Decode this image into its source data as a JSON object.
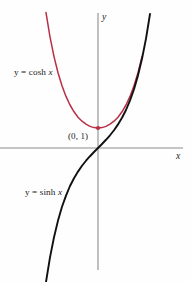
{
  "figure": {
    "background_color": "#fefefe",
    "width": 191,
    "height": 282
  },
  "axes": {
    "x_axis_label": "x",
    "y_axis_label": "y",
    "origin_px": [
      98,
      148
    ],
    "pixels_per_unit": 20,
    "axis_color": "#8b8b8b"
  },
  "labels": {
    "cosh_prefix": "y = ",
    "cosh_name": "cosh",
    "cosh_var": "x",
    "sinh_prefix": "y = ",
    "sinh_name": "sinh",
    "sinh_var": "x",
    "point_label": "(0, 1)"
  },
  "chart_data": {
    "type": "line",
    "title": "",
    "xlabel": "x",
    "ylabel": "y",
    "xlim": [
      -4.9,
      4.25
    ],
    "ylim": [
      -6.75,
      6.75
    ],
    "grid": false,
    "legend": "inline-annotations",
    "annotations": [
      {
        "text": "y = cosh x",
        "x": -4.2,
        "y": 3.75,
        "color": "#1a1a1a"
      },
      {
        "text": "y = sinh x",
        "x": -3.65,
        "y": -2.25,
        "color": "#1a1a1a"
      },
      {
        "text": "(0, 1)",
        "x": -1.5,
        "y": 0.55,
        "color": "#1a1a1a"
      }
    ],
    "markers": [
      {
        "label": "(0, 1)",
        "x": 0,
        "y": 1,
        "color": "#b92f46",
        "shape": "dot"
      }
    ],
    "series": [
      {
        "name": "y = cosh x",
        "color": "#b92f46",
        "x": [
          -2.6,
          -2.4,
          -2.2,
          -2.0,
          -1.8,
          -1.6,
          -1.4,
          -1.2,
          -1.0,
          -0.8,
          -0.6,
          -0.4,
          -0.2,
          0.0,
          0.2,
          0.4,
          0.6,
          0.8,
          1.0,
          1.2,
          1.4,
          1.6,
          1.8,
          2.0,
          2.2
        ],
        "values": [
          6.77,
          5.56,
          4.57,
          3.76,
          3.11,
          2.58,
          2.15,
          1.81,
          1.54,
          1.34,
          1.19,
          1.08,
          1.02,
          1.0,
          1.02,
          1.08,
          1.19,
          1.34,
          1.54,
          1.81,
          2.15,
          2.58,
          3.11,
          3.76,
          4.57
        ]
      },
      {
        "name": "y = sinh x",
        "color": "#111111",
        "x": [
          -2.6,
          -2.4,
          -2.2,
          -2.0,
          -1.8,
          -1.6,
          -1.4,
          -1.2,
          -1.0,
          -0.8,
          -0.6,
          -0.4,
          -0.2,
          0.0,
          0.2,
          0.4,
          0.6,
          0.8,
          1.0,
          1.2,
          1.4,
          1.6,
          1.8,
          2.0,
          2.2,
          2.4,
          2.6
        ],
        "values": [
          -6.7,
          -5.47,
          -4.46,
          -3.63,
          -2.94,
          -2.38,
          -1.9,
          -1.51,
          -1.18,
          -0.888,
          -0.637,
          -0.411,
          -0.201,
          0.0,
          0.201,
          0.411,
          0.637,
          0.888,
          1.18,
          1.51,
          1.9,
          2.38,
          2.94,
          3.63,
          4.46,
          5.47,
          6.7
        ]
      }
    ]
  }
}
